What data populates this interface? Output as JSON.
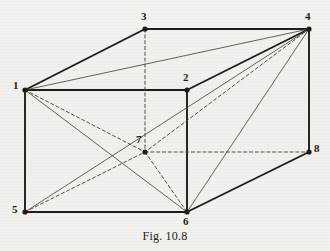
{
  "figure": {
    "caption": "Fig. 10.8",
    "background_color": "#f4f2ee",
    "ink_color": "#1d1a17",
    "thin_ink_color": "#4a4540",
    "width": 330,
    "height": 251
  },
  "chart_data": {
    "type": "diagram",
    "subtype": "3d-parallelepiped-wireframe",
    "title": "Fig. 10.8",
    "vertices": [
      {
        "id": "1",
        "label": "1",
        "x": 25,
        "y": 90,
        "label_x": 13,
        "label_y": 80,
        "hidden": false
      },
      {
        "id": "2",
        "label": "2",
        "x": 187,
        "y": 90,
        "label_x": 183,
        "label_y": 72,
        "hidden": false
      },
      {
        "id": "3",
        "label": "3",
        "x": 145,
        "y": 29,
        "label_x": 141,
        "label_y": 11,
        "hidden": false
      },
      {
        "id": "4",
        "label": "4",
        "x": 309,
        "y": 29,
        "label_x": 305,
        "label_y": 11,
        "hidden": false
      },
      {
        "id": "5",
        "label": "5",
        "x": 25,
        "y": 212,
        "label_x": 12,
        "label_y": 204,
        "hidden": false
      },
      {
        "id": "6",
        "label": "6",
        "x": 187,
        "y": 212,
        "label_x": 183,
        "label_y": 216,
        "hidden": false
      },
      {
        "id": "7",
        "label": "7",
        "x": 145,
        "y": 152,
        "label_x": 136,
        "label_y": 134,
        "hidden": true
      },
      {
        "id": "8",
        "label": "8",
        "x": 309,
        "y": 152,
        "label_x": 314,
        "label_y": 143,
        "hidden": false
      }
    ],
    "edges": [
      {
        "from": "1",
        "to": "2",
        "style": "solid",
        "weight": "thick",
        "kind": "edge"
      },
      {
        "from": "1",
        "to": "3",
        "style": "solid",
        "weight": "thick",
        "kind": "edge"
      },
      {
        "from": "3",
        "to": "4",
        "style": "solid",
        "weight": "thick",
        "kind": "edge"
      },
      {
        "from": "2",
        "to": "4",
        "style": "solid",
        "weight": "thick",
        "kind": "edge"
      },
      {
        "from": "1",
        "to": "5",
        "style": "solid",
        "weight": "thick",
        "kind": "edge"
      },
      {
        "from": "2",
        "to": "6",
        "style": "solid",
        "weight": "thick",
        "kind": "edge"
      },
      {
        "from": "4",
        "to": "8",
        "style": "solid",
        "weight": "thick",
        "kind": "edge"
      },
      {
        "from": "5",
        "to": "6",
        "style": "solid",
        "weight": "thick",
        "kind": "edge"
      },
      {
        "from": "6",
        "to": "8",
        "style": "solid",
        "weight": "thick",
        "kind": "edge"
      },
      {
        "from": "3",
        "to": "7",
        "style": "dashed",
        "weight": "thin",
        "kind": "hidden-edge"
      },
      {
        "from": "7",
        "to": "8",
        "style": "dashed",
        "weight": "thin",
        "kind": "hidden-edge"
      },
      {
        "from": "5",
        "to": "7",
        "style": "dashed",
        "weight": "thin",
        "kind": "hidden-edge"
      },
      {
        "from": "1",
        "to": "7",
        "style": "dashed",
        "weight": "thin",
        "kind": "hidden-diagonal"
      },
      {
        "from": "7",
        "to": "6",
        "style": "dashed",
        "weight": "thin",
        "kind": "hidden-diagonal"
      },
      {
        "from": "4",
        "to": "7",
        "style": "dashed",
        "weight": "thin",
        "kind": "hidden-diagonal"
      },
      {
        "from": "1",
        "to": "4",
        "style": "solid",
        "weight": "thin",
        "kind": "diagonal"
      },
      {
        "from": "1",
        "to": "6",
        "style": "solid",
        "weight": "thin",
        "kind": "diagonal"
      },
      {
        "from": "5",
        "to": "4",
        "style": "solid",
        "weight": "thin",
        "kind": "diagonal"
      },
      {
        "from": "4",
        "to": "6",
        "style": "solid",
        "weight": "thin",
        "kind": "diagonal"
      }
    ]
  }
}
